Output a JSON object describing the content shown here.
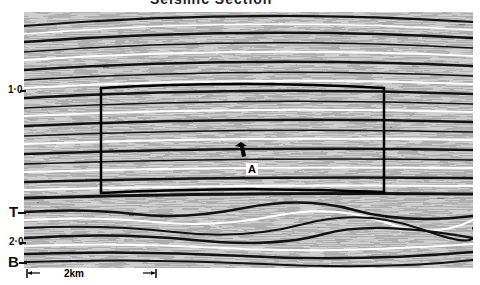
{
  "figure": {
    "title": "Seismic Section",
    "type": "seismic reflection profile",
    "time_axis": {
      "ticks": [
        {
          "label": "1·0",
          "y": 90
        },
        {
          "label": "2·0",
          "y": 242
        }
      ]
    },
    "horizons": [
      {
        "label": "T",
        "y": 212
      },
      {
        "label": "B",
        "y": 262
      }
    ],
    "annotation": {
      "label": "A",
      "type": "arrow"
    },
    "highlight_box": {
      "x1": 101,
      "y1": 88,
      "x2": 384,
      "y2": 193
    },
    "scale_bar": {
      "label": "2km"
    },
    "colors": {
      "background": "#ffffff",
      "ink": "#111111",
      "seismic_mid": "#c9c9c9"
    }
  }
}
